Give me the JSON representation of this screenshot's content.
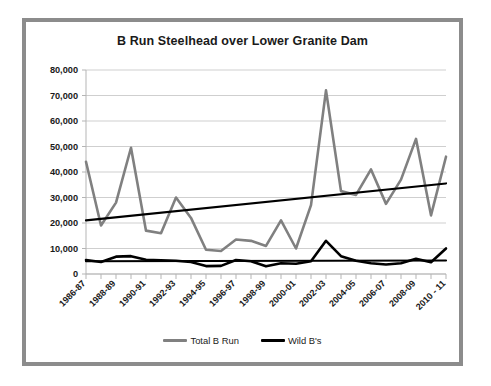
{
  "chart_data": {
    "type": "line",
    "title": "B Run Steelhead over Lower Granite Dam",
    "xlabel": "",
    "ylabel": "",
    "ylim": [
      0,
      80000
    ],
    "yticks": [
      0,
      10000,
      20000,
      30000,
      40000,
      50000,
      60000,
      70000,
      80000
    ],
    "ytick_labels": [
      "0",
      "10,000",
      "20,000",
      "30,000",
      "40,000",
      "50,000",
      "60,000",
      "70,000",
      "80,000"
    ],
    "grid": true,
    "legend_position": "bottom",
    "x": [
      "1986-87",
      "1987-88",
      "1988-89",
      "1989-90",
      "1990-91",
      "1991-92",
      "1992-93",
      "1993-94",
      "1994-95",
      "1995-96",
      "1996-97",
      "1997-98",
      "1998-99",
      "1999-00",
      "2000-01",
      "2001-02",
      "2002-03",
      "2003-04",
      "2004-05",
      "2005-06",
      "2006-07",
      "2007-08",
      "2008-09",
      "2009-10",
      "2010 - 11"
    ],
    "xtick_labels": [
      "1986-87",
      "1988-89",
      "1990-91",
      "1992-93",
      "1994-95",
      "1996-97",
      "1998-99",
      "2000-01",
      "2002-03",
      "2004-05",
      "2006-07",
      "2008-09",
      "2010 - 11"
    ],
    "series": [
      {
        "name": "Total B Run",
        "color": "#808080",
        "values": [
          44000,
          19000,
          28000,
          49500,
          17000,
          16000,
          30000,
          22000,
          9500,
          9000,
          13500,
          13000,
          11000,
          21000,
          10000,
          27000,
          72000,
          32500,
          31000,
          41000,
          27500,
          37000,
          53000,
          23000,
          46000
        ]
      },
      {
        "name": "Wild B's",
        "color": "#000000",
        "values": [
          5500,
          4700,
          6800,
          7000,
          5600,
          5400,
          5200,
          4700,
          3100,
          3200,
          5500,
          5000,
          3000,
          4200,
          4000,
          5000,
          13000,
          7000,
          5200,
          4200,
          3700,
          4200,
          6000,
          4600,
          10000
        ]
      }
    ],
    "trendlines": [
      {
        "name": "Total B Run trend",
        "color": "#000000",
        "start_value": 21000,
        "end_value": 35500
      },
      {
        "name": "Wild B's trend",
        "color": "#000000",
        "start_value": 5000,
        "end_value": 5300
      }
    ]
  },
  "legend": {
    "entries": [
      {
        "label": "Total B Run",
        "color": "#808080"
      },
      {
        "label": "Wild B's",
        "color": "#000000"
      }
    ]
  }
}
